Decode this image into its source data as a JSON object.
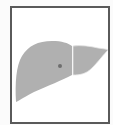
{
  "figure": {
    "colors": {
      "frame_border": "#5a5a5a",
      "background": "#ffffff",
      "organ_fill": "#b0b0b0",
      "lobe_divider": "#e6e6e6",
      "lesion_marker": "#6e6e6e"
    },
    "labels": []
  }
}
